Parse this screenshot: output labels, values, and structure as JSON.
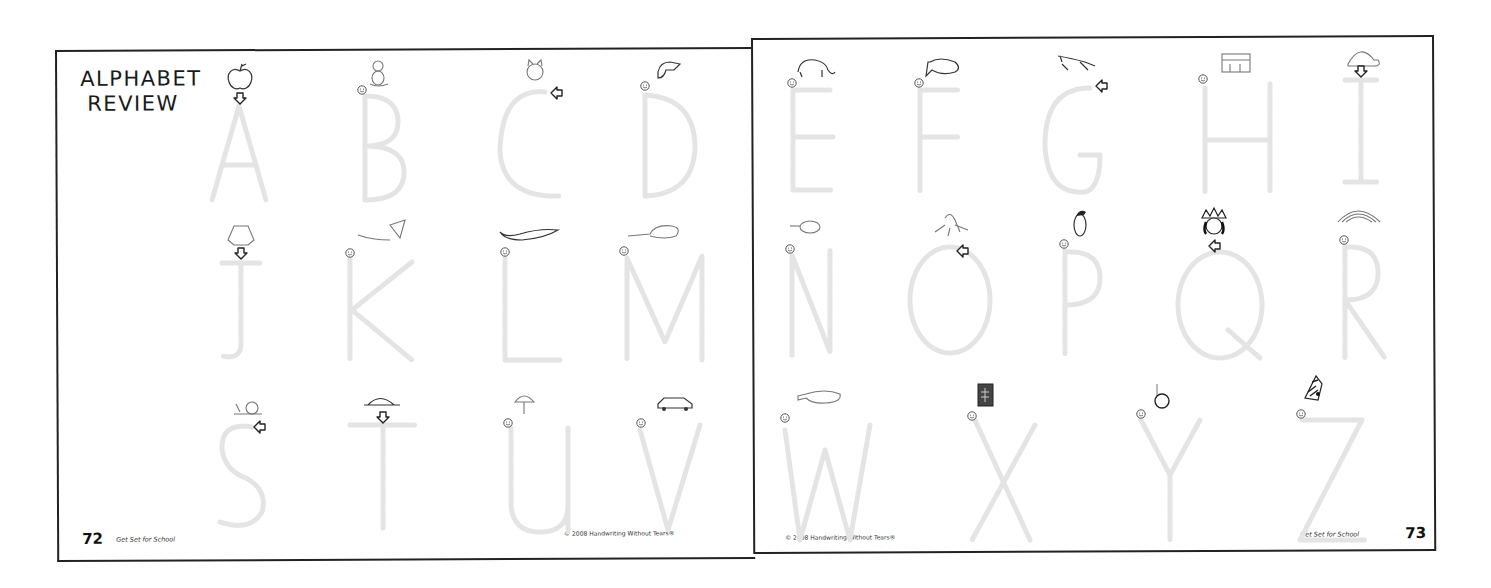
{
  "left_page": {
    "title_line1": "ALPHABET",
    "title_line2": "REVIEW",
    "page_number": "72",
    "book_title": "Get Set for School",
    "copyright": "© 2008 Handwriting Without Tears®",
    "letters": [
      {
        "letter": "A",
        "picture": "apple",
        "start": "arrow-down"
      },
      {
        "letter": "B",
        "picture": "teddy-bear",
        "start": "smiley"
      },
      {
        "letter": "C",
        "picture": "cat",
        "start": "arrow-left"
      },
      {
        "letter": "D",
        "picture": "dog",
        "start": "smiley"
      },
      {
        "letter": "J",
        "picture": "jacket",
        "start": "arrow-down"
      },
      {
        "letter": "K",
        "picture": "kite",
        "start": "smiley"
      },
      {
        "letter": "L",
        "picture": "lizard",
        "start": "smiley"
      },
      {
        "letter": "M",
        "picture": "mouse",
        "start": "smiley"
      },
      {
        "letter": "S",
        "picture": "snail",
        "start": "arrow-left"
      },
      {
        "letter": "T",
        "picture": "turtle",
        "start": "arrow-down"
      },
      {
        "letter": "U",
        "picture": "umbrella",
        "start": "smiley"
      },
      {
        "letter": "V",
        "picture": "van",
        "start": "smiley"
      }
    ]
  },
  "right_page": {
    "page_number": "73",
    "book_title": "Get Set for School",
    "copyright": "© 2008 Handwriting Without Tears®",
    "letters": [
      {
        "letter": "E",
        "picture": "elephant",
        "start": "smiley"
      },
      {
        "letter": "F",
        "picture": "fish",
        "start": "smiley"
      },
      {
        "letter": "G",
        "picture": "grasshopper",
        "start": "arrow-left"
      },
      {
        "letter": "H",
        "picture": "house",
        "start": "smiley"
      },
      {
        "letter": "I",
        "picture": "igloo",
        "start": "arrow-down"
      },
      {
        "letter": "N",
        "picture": "net",
        "start": "smiley"
      },
      {
        "letter": "O",
        "picture": "octopus",
        "start": "arrow-left"
      },
      {
        "letter": "P",
        "picture": "penguin",
        "start": "smiley"
      },
      {
        "letter": "Q",
        "picture": "queen",
        "start": "arrow-left"
      },
      {
        "letter": "R",
        "picture": "rainbow",
        "start": "smiley"
      },
      {
        "letter": "W",
        "picture": "whale",
        "start": "smiley"
      },
      {
        "letter": "X",
        "picture": "x-ray",
        "start": "smiley"
      },
      {
        "letter": "Y",
        "picture": "yo-yo",
        "start": "smiley"
      },
      {
        "letter": "Z",
        "picture": "zebra",
        "start": "smiley"
      }
    ]
  }
}
